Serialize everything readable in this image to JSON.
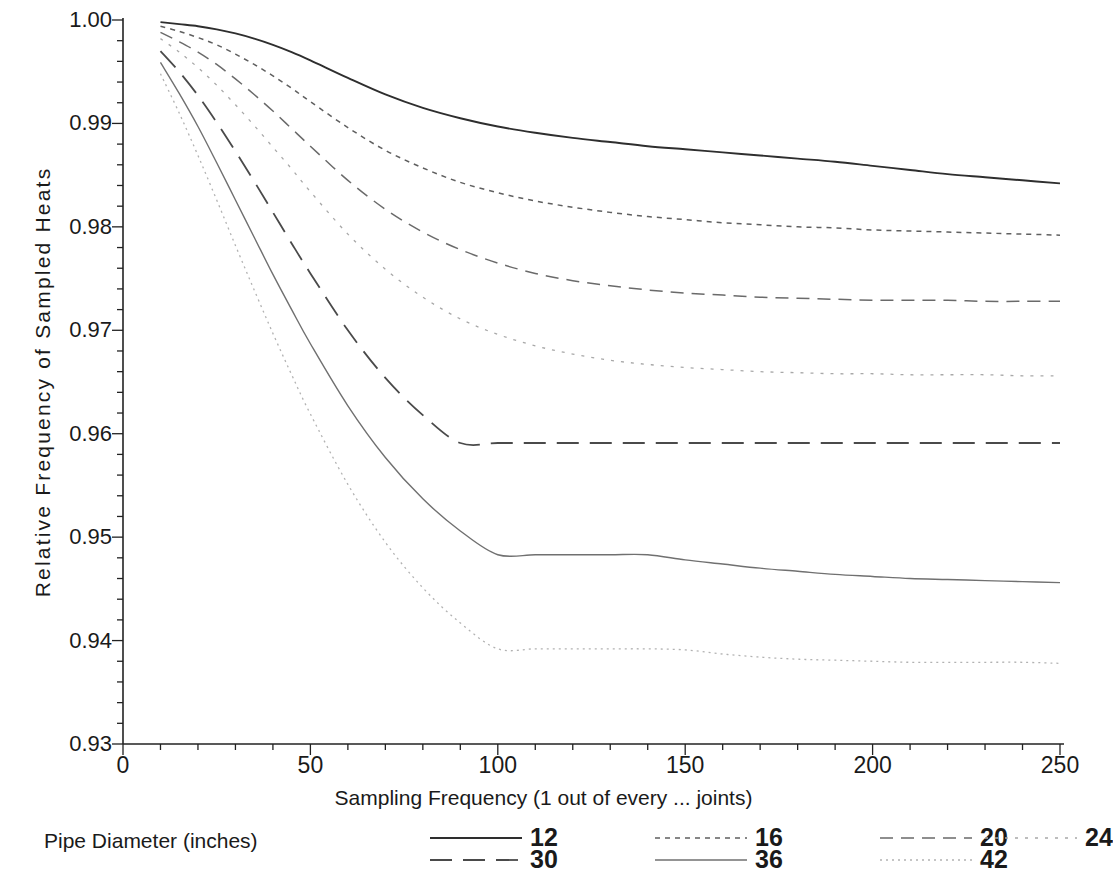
{
  "chart_data": {
    "type": "line",
    "title": "",
    "xlabel": "Sampling Frequency (1 out of every ... joints)",
    "ylabel": "Relative Frequency of Sampled Heats",
    "xlim": [
      0,
      250
    ],
    "ylim": [
      0.93,
      1.0
    ],
    "xticks": [
      "0",
      "50",
      "100",
      "150",
      "200",
      "250"
    ],
    "xtick_values": [
      0,
      50,
      100,
      150,
      200,
      250
    ],
    "yticks": [
      "0.93",
      "0.94",
      "0.95",
      "0.96",
      "0.97",
      "0.98",
      "0.99",
      "1.00"
    ],
    "ytick_values": [
      0.93,
      0.94,
      0.95,
      0.96,
      0.97,
      0.98,
      0.99,
      1.0
    ],
    "minor_tick_x_step": 10,
    "minor_tick_y_step": 0.002,
    "grid": false,
    "legend_position": "bottom",
    "legend_title": "Pipe Diameter (inches)",
    "x": [
      10,
      15,
      20,
      25,
      30,
      35,
      40,
      45,
      50,
      60,
      70,
      80,
      90,
      100,
      110,
      120,
      130,
      140,
      150,
      160,
      170,
      180,
      190,
      200,
      210,
      220,
      230,
      240,
      250
    ],
    "series": [
      {
        "name": "12",
        "dash": "solid",
        "values": [
          0.9998,
          0.9996,
          0.9994,
          0.9991,
          0.9987,
          0.9982,
          0.9976,
          0.9969,
          0.9961,
          0.9944,
          0.9928,
          0.9915,
          0.9905,
          0.9897,
          0.9891,
          0.9886,
          0.9882,
          0.9878,
          0.9875,
          0.9872,
          0.9869,
          0.9866,
          0.9863,
          0.9859,
          0.9855,
          0.9851,
          0.9848,
          0.9845,
          0.9842
        ]
      },
      {
        "name": "16",
        "dash": "dotted",
        "values": [
          0.9994,
          0.9989,
          0.9983,
          0.9976,
          0.9967,
          0.9957,
          0.9946,
          0.9934,
          0.9921,
          0.9896,
          0.9874,
          0.9857,
          0.9843,
          0.9833,
          0.9825,
          0.9819,
          0.9814,
          0.981,
          0.9807,
          0.9804,
          0.9802,
          0.98,
          0.9799,
          0.9797,
          0.9796,
          0.9795,
          0.9794,
          0.9793,
          0.9792
        ]
      },
      {
        "name": "20",
        "dash": "dashed",
        "values": [
          0.9988,
          0.9979,
          0.9969,
          0.9957,
          0.9943,
          0.9928,
          0.9912,
          0.9895,
          0.9878,
          0.9845,
          0.9817,
          0.9795,
          0.9778,
          0.9765,
          0.9755,
          0.9748,
          0.9743,
          0.9739,
          0.9736,
          0.9734,
          0.9732,
          0.9731,
          0.973,
          0.9729,
          0.9729,
          0.9729,
          0.9728,
          0.9728,
          0.9728
        ]
      },
      {
        "name": "24",
        "dash": "dotted-light",
        "values": [
          0.9982,
          0.9969,
          0.9954,
          0.9937,
          0.9918,
          0.9898,
          0.9877,
          0.9856,
          0.9834,
          0.9793,
          0.9759,
          0.9732,
          0.9711,
          0.9696,
          0.9685,
          0.9677,
          0.9671,
          0.9667,
          0.9664,
          0.9662,
          0.966,
          0.9659,
          0.9658,
          0.9658,
          0.9657,
          0.9657,
          0.9657,
          0.9656,
          0.9656
        ]
      },
      {
        "name": "30",
        "dash": "long-dash",
        "values": [
          0.997,
          0.995,
          0.9927,
          0.9901,
          0.9873,
          0.9844,
          0.9814,
          0.9784,
          0.9755,
          0.97,
          0.9654,
          0.9618,
          0.9591,
          0.9671,
          0.965,
          0.9635,
          0.9624,
          0.9617,
          0.9611,
          0.9607,
          0.9604,
          0.9601,
          0.9599,
          0.9598,
          0.9597,
          0.9596,
          0.9595,
          0.9595,
          0.9594
        ]
      },
      {
        "name": "36",
        "dash": "thin-solid",
        "values": [
          0.9959,
          0.9929,
          0.9897,
          0.9862,
          0.9826,
          0.979,
          0.9754,
          0.972,
          0.9687,
          0.9627,
          0.9577,
          0.9537,
          0.9506,
          0.9483,
          0.9513,
          0.95,
          0.9491,
          0.9484,
          0.9478,
          0.9474,
          0.947,
          0.9467,
          0.9464,
          0.9462,
          0.946,
          0.9459,
          0.9458,
          0.9457,
          0.9456
        ]
      },
      {
        "name": "42",
        "dash": "fine-dotted",
        "values": [
          0.9948,
          0.991,
          0.9869,
          0.9826,
          0.9782,
          0.9739,
          0.9697,
          0.9657,
          0.9619,
          0.9551,
          0.9495,
          0.9451,
          0.9417,
          0.9392,
          0.9424,
          0.9412,
          0.9403,
          0.9396,
          0.9391,
          0.9387,
          0.9384,
          0.9382,
          0.9381,
          0.938,
          0.9379,
          0.9379,
          0.9379,
          0.9379,
          0.9378
        ]
      }
    ],
    "legend_entries": [
      {
        "label": "12",
        "dash": "solid"
      },
      {
        "label": "16",
        "dash": "dotted"
      },
      {
        "label": "20",
        "dash": "dashed"
      },
      {
        "label": "24",
        "dash": "dotted-light"
      },
      {
        "label": "30",
        "dash": "long-dash"
      },
      {
        "label": "36",
        "dash": "thin-solid"
      },
      {
        "label": "42",
        "dash": "fine-dotted"
      }
    ]
  },
  "colors": {
    "axis": "#222222",
    "line": "#3a3a3a",
    "line_light": "#8c8c8c",
    "background": "#ffffff"
  }
}
